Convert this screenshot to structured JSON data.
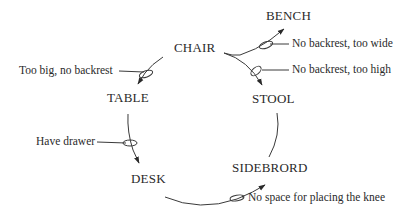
{
  "diagram": {
    "type": "evolution-cycle",
    "nodes": [
      {
        "id": "chair",
        "label": "CHAIR"
      },
      {
        "id": "bench",
        "label": "BENCH"
      },
      {
        "id": "stool",
        "label": "STOOL"
      },
      {
        "id": "table",
        "label": "TABLE"
      },
      {
        "id": "desk",
        "label": "DESK"
      },
      {
        "id": "sidebrord",
        "label": "SIDEBRORD"
      }
    ],
    "edges": [
      {
        "from": "chair",
        "to": "bench",
        "condition": "No backrest, too wide"
      },
      {
        "from": "chair",
        "to": "stool",
        "condition": "No backrest, too high"
      },
      {
        "from": "chair",
        "to": "table",
        "condition": "Too big, no backrest"
      },
      {
        "from": "table",
        "to": "desk",
        "condition": "Have drawer"
      },
      {
        "from": "desk",
        "to": "sidebrord",
        "condition": "No space for placing the knee"
      },
      {
        "from": "sidebrord",
        "to": "stool",
        "condition": ""
      }
    ],
    "colors": {
      "line": "#3a3a3a",
      "text": "#2a2a2a",
      "background": "#ffffff"
    }
  }
}
